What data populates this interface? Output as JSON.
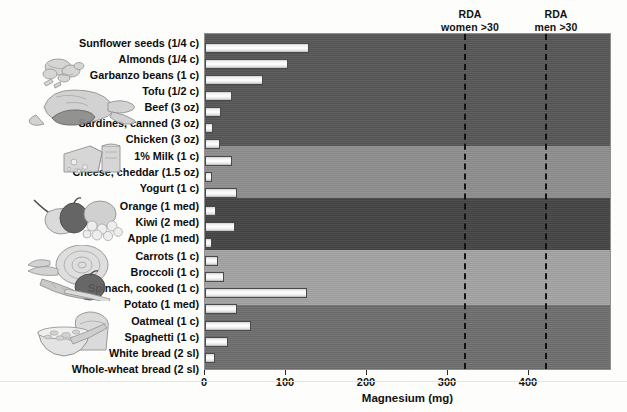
{
  "chart_data": {
    "type": "bar",
    "orientation": "horizontal",
    "title": "",
    "xlabel": "Magnesium (mg)",
    "ylabel": "",
    "xlim": [
      0,
      500
    ],
    "xticks": [
      0,
      100,
      200,
      300,
      400
    ],
    "xticklabels": [
      "0",
      "100",
      "200",
      "300",
      "400"
    ],
    "grid": false,
    "legend": "none",
    "categories": [
      "Sunflower seeds (1/4 c)",
      "Almonds  (1/4 c)",
      "Garbanzo beans (1 c)",
      "Tofu (1/2 c)",
      "Beef (3 oz)",
      "Sardines, canned (3 oz)",
      "Chicken (3 oz)",
      "1% Milk (1 c)",
      "Cheese, cheddar (1.5 oz)",
      "Yogurt (1 c)",
      "Orange (1 med)",
      "Kiwi (2 med)",
      "Apple (1 med)",
      "Carrots (1 c)",
      "Broccoli (1 c)",
      "Spinach, cooked (1 c)",
      "Potato (1 med)",
      "Oatmeal (1 c)",
      "Spaghetti (1 c)",
      "White bread (2 sl)",
      "Whole-wheat bread (2 sl)"
    ],
    "values": [
      128,
      102,
      72,
      33,
      20,
      10,
      19,
      33,
      9,
      40,
      13,
      37,
      9,
      16,
      24,
      126,
      40,
      57,
      29,
      12,
      52
    ],
    "annotations": [
      {
        "label": "RDA\nwomen >30",
        "line1": "RDA",
        "line2": "women >30",
        "value": 320
      },
      {
        "label": "RDA\nmen >30",
        "line1": "RDA",
        "line2": "men >30",
        "value": 420
      }
    ],
    "groups": [
      {
        "name": "nuts-seeds-protein",
        "count": 7,
        "band_color": "#575757"
      },
      {
        "name": "dairy",
        "count": 3,
        "band_color": "#8e8e8e"
      },
      {
        "name": "fruits",
        "count": 3,
        "band_color": "#454545"
      },
      {
        "name": "vegetables",
        "count": 4,
        "band_color": "#a3a3a3"
      },
      {
        "name": "grains",
        "count": 4,
        "band_color": "#6e6e6e"
      }
    ]
  },
  "axis": {
    "x_title": "Magnesium (mg)",
    "tick_0": "0",
    "tick_100": "100",
    "tick_200": "200",
    "tick_300": "300",
    "tick_400": "400"
  },
  "annotations": {
    "rda_women_line1": "RDA",
    "rda_women_line2": "women >30",
    "rda_men_line1": "RDA",
    "rda_men_line2": "men >30"
  },
  "labels": {
    "c0": "Sunflower seeds (1/4 c)",
    "c1": "Almonds  (1/4 c)",
    "c2": "Garbanzo beans (1 c)",
    "c3": "Tofu (1/2 c)",
    "c4": "Beef (3 oz)",
    "c5": "Sardines, canned (3 oz)",
    "c6": "Chicken (3 oz)",
    "c7": "1% Milk (1 c)",
    "c8": "Cheese, cheddar (1.5 oz)",
    "c9": "Yogurt (1 c)",
    "c10": "Orange (1 med)",
    "c11": "Kiwi (2 med)",
    "c12": "Apple (1 med)",
    "c13": "Carrots (1 c)",
    "c14": "Broccoli (1 c)",
    "c15": "Spinach, cooked (1 c)",
    "c16": "Potato (1 med)",
    "c17": "Oatmeal (1 c)",
    "c18": "Spaghetti (1 c)",
    "c19": "White bread (2 sl)",
    "c20": "Whole-wheat bread (2 sl)"
  },
  "illustrations": {
    "nuts": "nuts-and-seeds-illustration",
    "meat": "poultry-and-meat-illustration",
    "dairy": "cheese-and-milk-illustration",
    "fruit": "fruits-illustration",
    "vegetables": "vegetables-illustration",
    "grains": "bread-and-cereal-illustration"
  },
  "colors": {
    "bar_fill": "#ffffff",
    "bar_edge": "#4a4a4a",
    "band_protein": "#575757",
    "band_dairy": "#8e8e8e",
    "band_fruit": "#454545",
    "band_veg": "#a3a3a3",
    "band_grain": "#6e6e6e",
    "rda_line": "#111111",
    "text": "#0d0d0d"
  }
}
